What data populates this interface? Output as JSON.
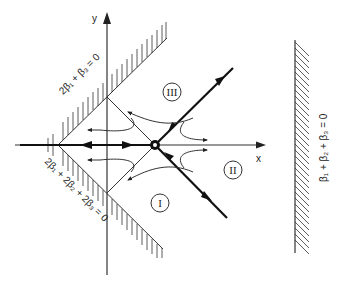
{
  "figure": {
    "axes": {
      "x_label": "x",
      "y_label": "y"
    },
    "boundaries": {
      "upper": "2β₁ + β₃ = 0",
      "lower": "2β₁ + 2β₂ + 2β₃ = 0",
      "right": "β₁ + β₂ + β₃ = 0"
    },
    "regions": [
      {
        "id": "I",
        "label": "I"
      },
      {
        "id": "II",
        "label": "II"
      },
      {
        "id": "III",
        "label": "III"
      }
    ],
    "fixed_point": "saddle point"
  }
}
